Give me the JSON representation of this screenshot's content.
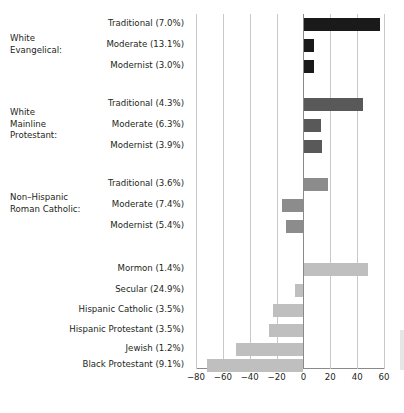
{
  "chart": {
    "title_sliver": "",
    "xlabel": "",
    "ylabel": ""
  },
  "axis": {
    "ticks": [
      {
        "label": "−80",
        "value": -80
      },
      {
        "label": "−60",
        "value": -60
      },
      {
        "label": "−40",
        "value": -40
      },
      {
        "label": "−20",
        "value": -20
      },
      {
        "label": "0",
        "value": 0
      },
      {
        "label": "20",
        "value": 20
      },
      {
        "label": "40",
        "value": 40
      },
      {
        "label": "60",
        "value": 60
      }
    ]
  },
  "groups": [
    {
      "label_lines": [
        "White",
        "Evangelical:"
      ]
    },
    {
      "label_lines": [
        "White",
        "Mainline",
        "Protestant:"
      ]
    },
    {
      "label_lines": [
        "Non–Hispanic",
        "Roman Catholic:"
      ]
    },
    {
      "label_lines": []
    }
  ],
  "chart_data": {
    "type": "bar",
    "orientation": "horizontal",
    "title": "",
    "xlabel": "",
    "ylabel": "",
    "xlim": [
      -80,
      60
    ],
    "xticks": [
      -80,
      -60,
      -40,
      -20,
      0,
      20,
      40,
      60
    ],
    "grid": true,
    "legend": "none",
    "colors": {
      "white_evangelical": "#1a1a1a",
      "white_mainline_protestant": "#595959",
      "non_hispanic_roman_catholic": "#8c8c8c",
      "other_groups": "#bfbfbf"
    },
    "groups": [
      {
        "name": "White Evangelical:",
        "color": "#1a1a1a",
        "bars": [
          {
            "label": "Traditional (7.0%)",
            "share": 7.0,
            "value": 57
          },
          {
            "label": "Moderate (13.1%)",
            "share": 13.1,
            "value": 8
          },
          {
            "label": "Modernist (3.0%)",
            "share": 3.0,
            "value": 8
          }
        ]
      },
      {
        "name": "White Mainline Protestant:",
        "color": "#595959",
        "bars": [
          {
            "label": "Traditional (4.3%)",
            "share": 4.3,
            "value": 44
          },
          {
            "label": "Moderate (6.3%)",
            "share": 6.3,
            "value": 13
          },
          {
            "label": "Modernist (3.9%)",
            "share": 3.9,
            "value": 14
          }
        ]
      },
      {
        "name": "Non–Hispanic Roman Catholic:",
        "color": "#8c8c8c",
        "bars": [
          {
            "label": "Traditional (3.6%)",
            "share": 3.6,
            "value": 18
          },
          {
            "label": "Moderate (7.4%)",
            "share": 7.4,
            "value": -16
          },
          {
            "label": "Modernist (5.4%)",
            "share": 5.4,
            "value": -13
          }
        ]
      },
      {
        "name": "",
        "color": "#bfbfbf",
        "bars": [
          {
            "label": "Mormon (1.4%)",
            "share": 1.4,
            "value": 48
          },
          {
            "label": "Secular (24.9%)",
            "share": 24.9,
            "value": -6
          },
          {
            "label": "Hispanic Catholic (3.5%)",
            "share": 3.5,
            "value": -23
          },
          {
            "label": "Hispanic Protestant (3.5%)",
            "share": 3.5,
            "value": -26
          },
          {
            "label": "Jewish (1.2%)",
            "share": 1.2,
            "value": -50
          },
          {
            "label": "Black Protestant (9.1%)",
            "share": 9.1,
            "value": -72
          }
        ]
      }
    ]
  }
}
